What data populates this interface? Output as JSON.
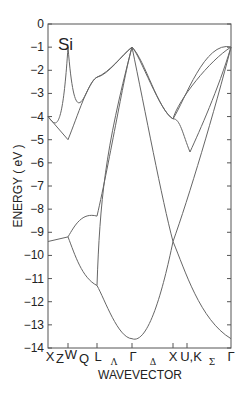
{
  "chart_data": {
    "type": "line",
    "title": "",
    "material_label": "Si",
    "xlabel": "WAVEVECTOR",
    "ylabel": "ENERGY ( eV )",
    "ylim": [
      -14,
      0
    ],
    "yticks": [
      0,
      -1,
      -2,
      -3,
      -4,
      -5,
      -6,
      -7,
      -8,
      -9,
      -10,
      -11,
      -12,
      -13,
      -14
    ],
    "grid": false,
    "legend": null,
    "kpoints": [
      {
        "label": "X",
        "pos": 0.0,
        "tick": false
      },
      {
        "label": "Z",
        "pos": 0.06,
        "tick": false,
        "segment": true
      },
      {
        "label": "W",
        "pos": 0.11,
        "tick": true
      },
      {
        "label": "Q",
        "pos": 0.19,
        "tick": false,
        "segment": true
      },
      {
        "label": "L",
        "pos": 0.27,
        "tick": true
      },
      {
        "label": "Λ",
        "pos": 0.37,
        "tick": false,
        "segment": true
      },
      {
        "label": "Γ",
        "pos": 0.46,
        "tick": true
      },
      {
        "label": "Δ",
        "pos": 0.56,
        "tick": false,
        "segment": true
      },
      {
        "label": "X",
        "pos": 0.68,
        "tick": true
      },
      {
        "label": "U,K",
        "pos": 0.75,
        "tick": true
      },
      {
        "label": "Σ",
        "pos": 0.88,
        "tick": false,
        "segment": true
      },
      {
        "label": "Γ",
        "pos": 1.0,
        "tick": false
      }
    ],
    "series": [
      {
        "name": "band-1 (lowest)",
        "x": [
          "X",
          "W",
          "L",
          "Γ",
          "X",
          "U,K",
          "Γ"
        ],
        "values": [
          -9.4,
          -9.2,
          -11.3,
          -13.6,
          -9.4,
          -10.5,
          -13.6
        ]
      },
      {
        "name": "band-2",
        "x": [
          "X",
          "W",
          "L",
          "Γ",
          "X",
          "U,K",
          "Γ"
        ],
        "values": [
          -9.4,
          -9.2,
          -8.3,
          -1.0,
          -9.4,
          -8.5,
          -1.0
        ]
      },
      {
        "name": "band-3",
        "x": [
          "X",
          "W",
          "L",
          "Γ",
          "X",
          "U,K",
          "Γ"
        ],
        "values": [
          -4.0,
          -5.0,
          -2.3,
          -1.0,
          -4.1,
          -5.5,
          -1.0
        ]
      },
      {
        "name": "band-4 (VBM)",
        "x": [
          "X",
          "W",
          "L",
          "Γ",
          "X",
          "U,K",
          "Γ"
        ],
        "values": [
          -4.0,
          -5.3,
          -2.3,
          -1.0,
          -4.1,
          -4.5,
          -1.0
        ]
      }
    ]
  }
}
